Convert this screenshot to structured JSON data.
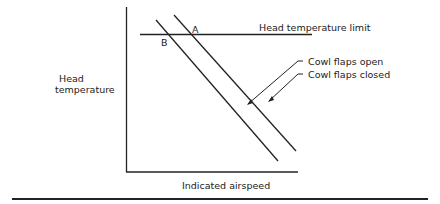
{
  "diagram": {
    "y_axis_label_line1": "Head",
    "y_axis_label_line2": "temperature",
    "x_axis_label": "Indicated airspeed",
    "limit_label": "Head temperature limit",
    "point_a": "A",
    "point_b": "B",
    "legend_open": "Cowl flaps open",
    "legend_closed": "Cowl flaps closed",
    "line_color": "#222222"
  }
}
